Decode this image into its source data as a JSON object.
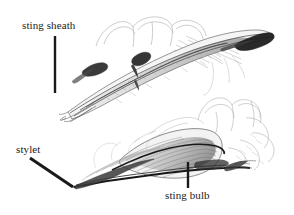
{
  "figure": {
    "kind": "scientific-line-illustration",
    "background_color": "#ffffff",
    "ink_color": "#1a1a1a",
    "width": 294,
    "height": 215,
    "specimen_count": 2
  },
  "labels": [
    {
      "id": "sting-sheath",
      "text": "sting sheath",
      "x": 22,
      "y": 19,
      "leader": {
        "type": "vertical",
        "x1": 55,
        "y1": 36,
        "x2": 55,
        "y2": 93,
        "width": 2.4
      }
    },
    {
      "id": "stylet",
      "text": "stylet",
      "x": 16,
      "y": 143,
      "leader": {
        "type": "diagonal",
        "x1": 30,
        "y1": 158,
        "x2": 73,
        "y2": 187,
        "width": 3.0
      }
    },
    {
      "id": "sting-bulb",
      "text": "sting bulb",
      "x": 165,
      "y": 189,
      "leader": {
        "type": "vertical",
        "x1": 188,
        "y1": 162,
        "x2": 188,
        "y2": 188,
        "width": 2.4
      }
    }
  ],
  "specimens": [
    {
      "id": "upper-specimen",
      "name": "sting sheath and stylet, dorsal-lateral view",
      "bbox": [
        62,
        12,
        276,
        120
      ],
      "orientation": "tip-lower-left to bulb-upper-right"
    },
    {
      "id": "lower-specimen",
      "name": "sting bulb with stylet, lateral view",
      "bbox": [
        70,
        100,
        290,
        190
      ],
      "orientation": "tip-lower-left to bulb-right"
    }
  ]
}
